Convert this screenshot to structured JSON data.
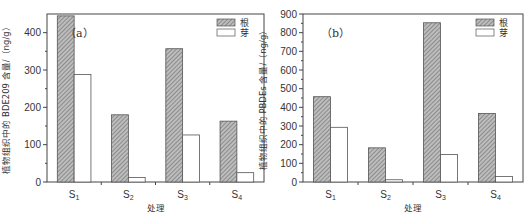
{
  "chart_data": [
    {
      "type": "bar",
      "panel_label": "（a）",
      "title": "",
      "xlabel": "处理",
      "ylabel": "植物组织中的 BDE209 含量/（ng/g）",
      "categories": [
        {
          "main": "S",
          "sub": "1"
        },
        {
          "main": "S",
          "sub": "2"
        },
        {
          "main": "S",
          "sub": "3"
        },
        {
          "main": "S",
          "sub": "4"
        }
      ],
      "ylim": [
        0,
        450
      ],
      "yticks": [
        0,
        100,
        200,
        300,
        400
      ],
      "series": [
        {
          "name": "根",
          "pattern": "hatched",
          "values": [
            445,
            180,
            357,
            163
          ]
        },
        {
          "name": "芽",
          "pattern": "open",
          "values": [
            288,
            12,
            126,
            25
          ]
        }
      ],
      "legend": "top-right",
      "grid": false
    },
    {
      "type": "bar",
      "panel_label": "（b）",
      "title": "",
      "xlabel": "处理",
      "ylabel": "植物组织中的 PBDEs 含量/（ng/g）",
      "categories": [
        {
          "main": "S",
          "sub": "1"
        },
        {
          "main": "S",
          "sub": "2"
        },
        {
          "main": "S",
          "sub": "3"
        },
        {
          "main": "S",
          "sub": "4"
        }
      ],
      "ylim": [
        0,
        900
      ],
      "yticks": [
        0,
        100,
        200,
        300,
        400,
        500,
        600,
        700,
        800,
        900
      ],
      "series": [
        {
          "name": "根",
          "pattern": "hatched",
          "values": [
            457,
            183,
            853,
            367
          ]
        },
        {
          "name": "芽",
          "pattern": "open",
          "values": [
            293,
            12,
            147,
            29
          ]
        }
      ],
      "legend": "top-right",
      "grid": false
    }
  ]
}
